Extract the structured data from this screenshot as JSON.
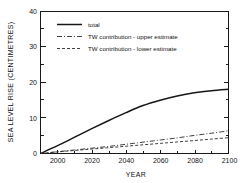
{
  "chart_data": {
    "type": "line",
    "title": "",
    "xlabel": "YEAR",
    "ylabel": "SEA LEVEL RISE (CENTIMETRES)",
    "xlim": [
      1990,
      2100
    ],
    "ylim": [
      0,
      40
    ],
    "grid": false,
    "legend_position": "upper left",
    "x_ticklabels": [
      "2000",
      "2020",
      "2040",
      "2060",
      "2080",
      "2100"
    ],
    "x_tickvalues": [
      2000,
      2020,
      2040,
      2060,
      2080,
      2100
    ],
    "x_minor_interval": 10,
    "y_ticklabels": [
      "0",
      "10",
      "20",
      "30",
      "40"
    ],
    "y_tickvalues": [
      0,
      10,
      20,
      30,
      40
    ],
    "y_minor_interval": 5,
    "x": [
      1990,
      2000,
      2010,
      2020,
      2030,
      2040,
      2050,
      2060,
      2070,
      2080,
      2090,
      2100
    ],
    "series": [
      {
        "name": "total",
        "style": "solid",
        "values": [
          0.0,
          2.2,
          4.6,
          7.0,
          9.3,
          11.5,
          13.5,
          15.0,
          16.2,
          17.1,
          17.7,
          18.1
        ]
      },
      {
        "name": "TW contribution - upper estimate",
        "style": "dash-dot",
        "values": [
          0.0,
          0.5,
          1.0,
          1.5,
          2.0,
          2.6,
          3.2,
          3.8,
          4.4,
          5.1,
          5.7,
          6.4
        ]
      },
      {
        "name": "TW contribution - lower estimate",
        "style": "dashed",
        "values": [
          0.0,
          0.45,
          0.85,
          1.25,
          1.65,
          2.05,
          2.45,
          2.85,
          3.25,
          3.65,
          4.05,
          4.45
        ]
      }
    ]
  },
  "legend": {
    "entries": [
      {
        "label": "total"
      },
      {
        "label": "TW contribution - upper estimate"
      },
      {
        "label": "TW contribution - lower estimate"
      }
    ]
  },
  "axes": {
    "x_title": "YEAR",
    "y_title": "SEA LEVEL RISE (CENTIMETRES)"
  }
}
